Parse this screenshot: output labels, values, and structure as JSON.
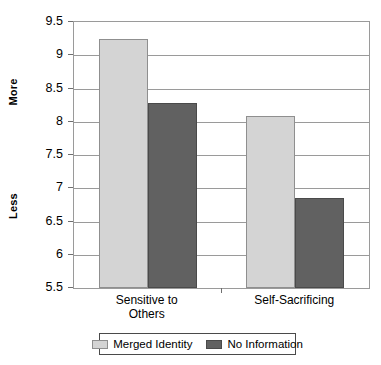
{
  "chart_data": {
    "type": "bar",
    "title": "",
    "subtitle": "",
    "xlabel": "",
    "ylabel": "",
    "ylabel_top": "More",
    "ylabel_bottom": "Less",
    "categories": [
      "Sensitive to\nOthers",
      "Self-Sacrificing"
    ],
    "series": [
      {
        "name": "Merged Identity",
        "color": "#d4d4d4",
        "values": [
          9.25,
          8.08
        ]
      },
      {
        "name": "No Information",
        "color": "#616161",
        "values": [
          8.28,
          6.85
        ]
      }
    ],
    "ylim": [
      5.5,
      9.5
    ],
    "yticks": [
      5.5,
      6,
      6.5,
      7,
      7.5,
      8,
      8.5,
      9,
      9.5
    ],
    "ytick_labels": [
      "5.5",
      "6",
      "6.5",
      "7",
      "7.5",
      "8",
      "8.5",
      "9",
      "9.5"
    ],
    "grid": true,
    "grid_axis": "y",
    "legend_position": "bottom",
    "border_color": "#9a9a9a",
    "background": "#ffffff"
  },
  "legend": {
    "items": [
      {
        "label": "Merged Identity",
        "swatch": "light"
      },
      {
        "label": "No Information",
        "swatch": "dark"
      }
    ]
  },
  "axis": {
    "more_label": "More",
    "less_label": "Less"
  }
}
